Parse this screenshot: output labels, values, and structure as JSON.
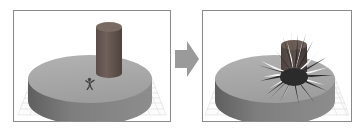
{
  "figure": {
    "caption": "",
    "background_color": "#ffffff",
    "panel_border_color": "#8a8a8a",
    "width": 364,
    "height": 133
  },
  "transition_arrow": {
    "icon": "right-arrow-icon",
    "direction": "right",
    "color": "#9a9a9a",
    "label": ""
  },
  "panels": [
    {
      "id": "before",
      "name": "before-simulation-panel",
      "title": "",
      "scene": {
        "ground_grid": {
          "visible": true,
          "color": "#cfcfcf",
          "cell_count": 24,
          "label": "grid-plane"
        },
        "platform": {
          "shape": "cylinder-disc",
          "top_color": "#a8a8a8",
          "side_color": "#7c7c7c",
          "label": "disc-platform"
        },
        "pillar": {
          "shape": "cylinder",
          "state": "intact",
          "top_color": "#6e5f5a",
          "side_color": "#5d4f4a",
          "height_px": 74,
          "label": "standing-pillar"
        },
        "character": {
          "shape": "humanoid",
          "color": "#4a4a4a",
          "pose": "running",
          "label": "humanoid-agent"
        },
        "fracture": {
          "visible": false,
          "label": "fracture-burst"
        }
      }
    },
    {
      "id": "after",
      "name": "after-simulation-panel",
      "title": "",
      "scene": {
        "ground_grid": {
          "visible": true,
          "color": "#cfcfcf",
          "cell_count": 24,
          "label": "grid-plane"
        },
        "platform": {
          "shape": "cylinder-disc",
          "top_color": "#a8a8a8",
          "side_color": "#7c7c7c",
          "label": "disc-platform"
        },
        "pillar": {
          "shape": "cylinder",
          "state": "shattered",
          "top_color": "#6e5f5a",
          "side_color": "#4a3f3b",
          "height_px": 26,
          "label": "shattered-pillar"
        },
        "character": {
          "shape": "humanoid",
          "color": "#4a4a4a",
          "pose": "hidden",
          "label": "humanoid-agent",
          "visible": false
        },
        "fracture": {
          "visible": true,
          "shape": "starburst",
          "spike_count": 18,
          "dark_color": "#2b2b2b",
          "light_color": "#f2f2f2",
          "label": "fracture-burst"
        }
      }
    }
  ]
}
